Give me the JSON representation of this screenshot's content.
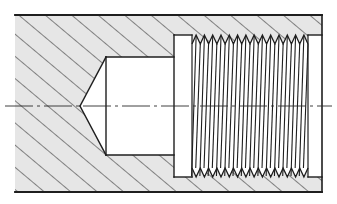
{
  "drawing": {
    "title": "Sectional view of threaded blind hole with drill point and thread relief",
    "colors": {
      "background": "#ffffff",
      "line": "#1e1e1e",
      "hatch_fill": "#e6e6e6",
      "hatch_line": "#2a2a2a",
      "centerline": "#2a2a2a"
    },
    "geometry": {
      "outer": {
        "left": 15,
        "right": 322,
        "top": 15,
        "bottom": 192
      },
      "axis_y": 106,
      "centerline": {
        "x1": 5,
        "x2": 332
      },
      "drill_bore": {
        "x1": 106,
        "x2": 174,
        "top": 57,
        "bottom": 155
      },
      "drill_point_tip_x": 80,
      "relief_groove": {
        "x1": 174,
        "x2": 192,
        "top": 35,
        "bottom": 177
      },
      "thread": {
        "x1": 192,
        "x2": 308,
        "root_top": 35,
        "crest_top": 44,
        "root_bottom": 177,
        "crest_bottom": 168,
        "pitch": 8.3,
        "count": 14
      },
      "end_chamfer": {
        "x": 308,
        "to_x": 322
      },
      "hatch_spacing": 17
    },
    "labels": {
      "centerline": "center axis",
      "section": "hatched section"
    }
  }
}
